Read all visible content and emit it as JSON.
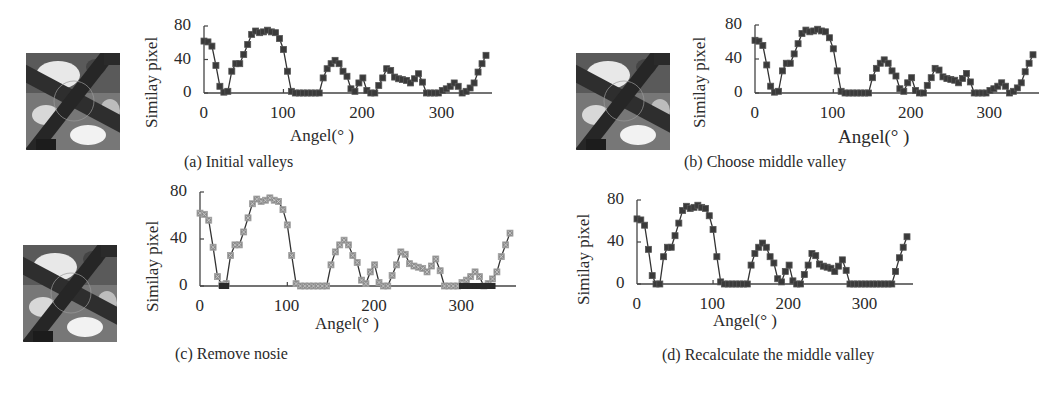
{
  "figure": {
    "panels": [
      {
        "id": "a",
        "caption": "(a) Initial valleys"
      },
      {
        "id": "b",
        "caption": "(b) Choose middle valley"
      },
      {
        "id": "c",
        "caption": "(c) Remove nosie"
      },
      {
        "id": "d",
        "caption": "(d) Recalculate the middle valley"
      }
    ],
    "ylabel": "Similay pixel",
    "xlabel": "Angel(°  )",
    "yticks": [
      "0",
      "40",
      "80"
    ],
    "xticks": [
      "0",
      "100",
      "200",
      "300"
    ],
    "thumbnail_icon": "aerial-road-intersection-image",
    "colors": {
      "series": "#3a3a3a",
      "series_light": "#8a8a8a",
      "axis": "#444444"
    }
  },
  "chart_data": [
    {
      "type": "line",
      "title": "(a) Initial valleys",
      "xlabel": "Angel(°)",
      "ylabel": "Similay pixel",
      "xlim": [
        0,
        360
      ],
      "ylim": [
        0,
        80
      ],
      "xticks": [
        0,
        100,
        200,
        300
      ],
      "yticks": [
        0,
        40,
        80
      ],
      "grid": false,
      "x": [
        0,
        5,
        10,
        15,
        20,
        25,
        30,
        35,
        40,
        45,
        50,
        55,
        60,
        65,
        70,
        75,
        80,
        85,
        90,
        95,
        100,
        105,
        110,
        115,
        120,
        125,
        130,
        135,
        140,
        145,
        150,
        155,
        160,
        165,
        170,
        175,
        180,
        185,
        190,
        195,
        200,
        205,
        210,
        215,
        220,
        225,
        230,
        235,
        240,
        245,
        250,
        255,
        260,
        265,
        270,
        275,
        280,
        285,
        290,
        295,
        300,
        305,
        310,
        315,
        320,
        325,
        330,
        335,
        340,
        345,
        350,
        355
      ],
      "series": [
        {
          "name": "Similar pixels",
          "values": [
            62,
            61,
            56,
            33,
            8,
            1,
            2,
            26,
            35,
            35,
            46,
            58,
            70,
            74,
            72,
            73,
            75,
            73,
            72,
            65,
            52,
            26,
            2,
            0,
            0,
            0,
            0,
            0,
            0,
            0,
            18,
            29,
            35,
            39,
            35,
            26,
            20,
            5,
            2,
            12,
            18,
            3,
            0,
            0,
            9,
            18,
            29,
            27,
            19,
            17,
            16,
            15,
            12,
            17,
            23,
            13,
            0,
            0,
            0,
            0,
            3,
            5,
            8,
            12,
            8,
            0,
            2,
            6,
            12,
            25,
            35,
            45
          ]
        }
      ]
    },
    {
      "type": "line",
      "title": "(b) Choose middle valley",
      "xlabel": "Angel(°)",
      "ylabel": "Similay pixel",
      "xlim": [
        0,
        360
      ],
      "ylim": [
        0,
        80
      ],
      "xticks": [
        0,
        100,
        200,
        300
      ],
      "yticks": [
        0,
        40,
        80
      ],
      "grid": false,
      "x": [
        0,
        5,
        10,
        15,
        20,
        25,
        30,
        35,
        40,
        45,
        50,
        55,
        60,
        65,
        70,
        75,
        80,
        85,
        90,
        95,
        100,
        105,
        110,
        115,
        120,
        125,
        130,
        135,
        140,
        145,
        150,
        155,
        160,
        165,
        170,
        175,
        180,
        185,
        190,
        195,
        200,
        205,
        210,
        215,
        220,
        225,
        230,
        235,
        240,
        245,
        250,
        255,
        260,
        265,
        270,
        275,
        280,
        285,
        290,
        295,
        300,
        305,
        310,
        315,
        320,
        325,
        330,
        335,
        340,
        345,
        350,
        355
      ],
      "series": [
        {
          "name": "Similar pixels",
          "values": [
            62,
            61,
            56,
            33,
            8,
            1,
            2,
            26,
            35,
            35,
            46,
            58,
            70,
            74,
            72,
            73,
            75,
            73,
            72,
            65,
            52,
            26,
            2,
            0,
            0,
            0,
            0,
            0,
            0,
            0,
            18,
            29,
            35,
            39,
            35,
            26,
            20,
            5,
            2,
            12,
            18,
            3,
            0,
            0,
            9,
            18,
            29,
            27,
            19,
            17,
            16,
            15,
            12,
            17,
            23,
            13,
            0,
            0,
            0,
            0,
            3,
            5,
            8,
            12,
            8,
            0,
            2,
            6,
            12,
            25,
            35,
            45
          ]
        }
      ]
    },
    {
      "type": "line",
      "title": "(c) Remove nosie",
      "xlabel": "Angel(°)",
      "ylabel": "Similay pixel",
      "xlim": [
        0,
        360
      ],
      "ylim": [
        0,
        80
      ],
      "xticks": [
        0,
        100,
        200,
        300
      ],
      "yticks": [
        0,
        40,
        80
      ],
      "grid": false,
      "x": [
        0,
        5,
        10,
        15,
        20,
        25,
        30,
        35,
        40,
        45,
        50,
        55,
        60,
        65,
        70,
        75,
        80,
        85,
        90,
        95,
        100,
        105,
        110,
        115,
        120,
        125,
        130,
        135,
        140,
        145,
        150,
        155,
        160,
        165,
        170,
        175,
        180,
        185,
        190,
        195,
        200,
        205,
        210,
        215,
        220,
        225,
        230,
        235,
        240,
        245,
        250,
        255,
        260,
        265,
        270,
        275,
        280,
        285,
        290,
        295,
        300,
        305,
        310,
        315,
        320,
        325,
        330,
        335,
        340,
        345,
        350,
        355
      ],
      "series": [
        {
          "name": "Original",
          "values": [
            62,
            61,
            56,
            33,
            8,
            1,
            2,
            26,
            35,
            35,
            46,
            58,
            70,
            74,
            72,
            73,
            75,
            73,
            72,
            65,
            52,
            26,
            2,
            0,
            0,
            0,
            0,
            0,
            0,
            0,
            18,
            29,
            35,
            39,
            35,
            26,
            20,
            5,
            2,
            12,
            18,
            3,
            0,
            0,
            9,
            18,
            29,
            27,
            19,
            17,
            16,
            15,
            12,
            17,
            23,
            13,
            0,
            0,
            0,
            0,
            3,
            5,
            8,
            12,
            8,
            0,
            2,
            6,
            12,
            25,
            35,
            45
          ]
        },
        {
          "name": "Denoised",
          "values": [
            62,
            61,
            56,
            33,
            8,
            0,
            0,
            26,
            35,
            35,
            46,
            58,
            70,
            74,
            72,
            73,
            75,
            73,
            72,
            65,
            52,
            26,
            2,
            0,
            0,
            0,
            0,
            0,
            0,
            0,
            18,
            29,
            35,
            39,
            35,
            26,
            20,
            5,
            2,
            12,
            18,
            3,
            0,
            0,
            9,
            18,
            29,
            27,
            19,
            17,
            16,
            15,
            12,
            17,
            23,
            13,
            0,
            0,
            0,
            0,
            0,
            0,
            0,
            0,
            0,
            0,
            0,
            0,
            12,
            25,
            35,
            45
          ]
        }
      ]
    },
    {
      "type": "line",
      "title": "(d) Recalculate the middle valley",
      "xlabel": "Angel(°)",
      "ylabel": "Similay pixel",
      "xlim": [
        0,
        360
      ],
      "ylim": [
        0,
        80
      ],
      "xticks": [
        0,
        100,
        200,
        300
      ],
      "yticks": [
        0,
        40,
        80
      ],
      "grid": false,
      "x": [
        0,
        5,
        10,
        15,
        20,
        25,
        30,
        35,
        40,
        45,
        50,
        55,
        60,
        65,
        70,
        75,
        80,
        85,
        90,
        95,
        100,
        105,
        110,
        115,
        120,
        125,
        130,
        135,
        140,
        145,
        150,
        155,
        160,
        165,
        170,
        175,
        180,
        185,
        190,
        195,
        200,
        205,
        210,
        215,
        220,
        225,
        230,
        235,
        240,
        245,
        250,
        255,
        260,
        265,
        270,
        275,
        280,
        285,
        290,
        295,
        300,
        305,
        310,
        315,
        320,
        325,
        330,
        335,
        340,
        345,
        350,
        355
      ],
      "series": [
        {
          "name": "Similar pixels",
          "values": [
            62,
            61,
            56,
            33,
            8,
            0,
            0,
            26,
            35,
            35,
            46,
            58,
            70,
            74,
            72,
            73,
            75,
            73,
            72,
            65,
            52,
            26,
            2,
            0,
            0,
            0,
            0,
            0,
            0,
            0,
            18,
            29,
            35,
            39,
            35,
            26,
            20,
            5,
            2,
            12,
            18,
            3,
            0,
            0,
            9,
            18,
            29,
            27,
            19,
            17,
            16,
            15,
            12,
            17,
            23,
            13,
            0,
            0,
            0,
            0,
            0,
            0,
            0,
            0,
            0,
            0,
            0,
            0,
            12,
            25,
            35,
            45
          ]
        }
      ]
    }
  ]
}
